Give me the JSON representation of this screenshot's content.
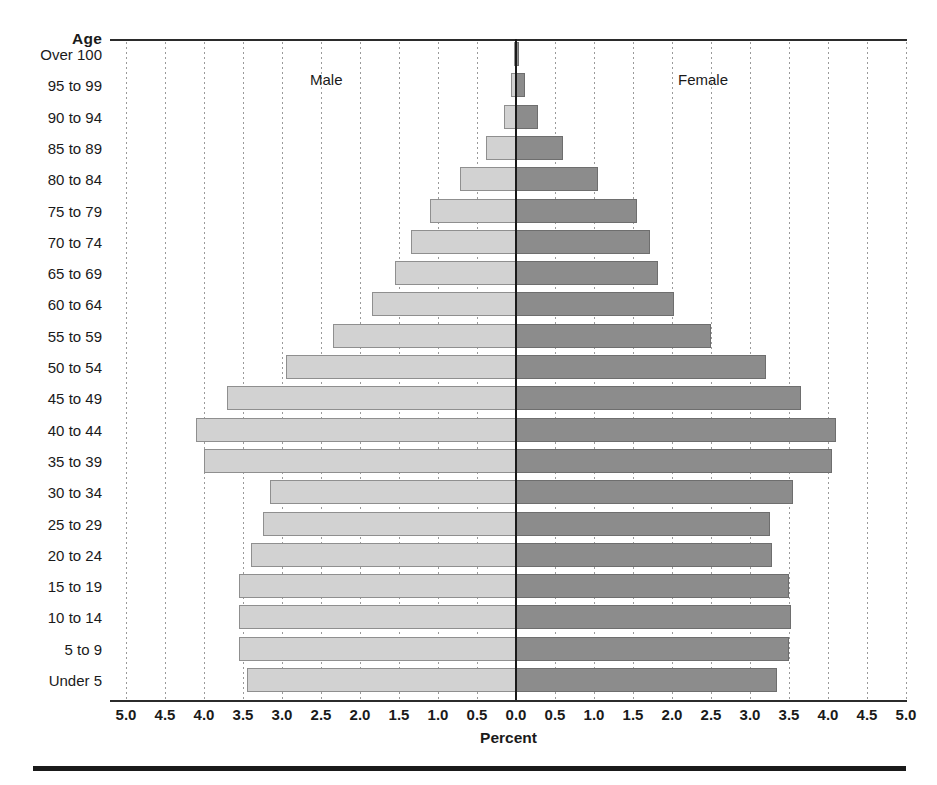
{
  "chart_data": {
    "type": "bar",
    "subtype": "population-pyramid",
    "title": "",
    "xlabel": "Percent",
    "ylabel": "Age",
    "xlim": [
      -5.0,
      5.0
    ],
    "grid": true,
    "legend_position": "in-plot",
    "x_tick_labels": [
      "5.0",
      "4.5",
      "4.0",
      "3.5",
      "3.0",
      "2.5",
      "2.0",
      "1.5",
      "1.0",
      "0.5",
      "0.0",
      "0.5",
      "1.0",
      "1.5",
      "2.0",
      "2.5",
      "3.0",
      "3.5",
      "4.0",
      "4.5",
      "5.0"
    ],
    "x_tick_values": [
      -5.0,
      -4.5,
      -4.0,
      -3.5,
      -3.0,
      -2.5,
      -2.0,
      -1.5,
      -1.0,
      -0.5,
      0.0,
      0.5,
      1.0,
      1.5,
      2.0,
      2.5,
      3.0,
      3.5,
      4.0,
      4.5,
      5.0
    ],
    "categories": [
      "Over 100",
      "95 to 99",
      "90 to 94",
      "85 to 89",
      "80 to 84",
      "75 to 79",
      "70 to 74",
      "65 to 69",
      "60 to 64",
      "55 to 59",
      "50 to 54",
      "45 to 49",
      "40 to 44",
      "35 to 39",
      "30 to 34",
      "25 to 29",
      "20 to 24",
      "15 to 19",
      "10 to 14",
      "5 to 9",
      "Under 5"
    ],
    "series": [
      {
        "name": "Male",
        "side": "left",
        "color": "#d2d2d2",
        "border_color": "#8f8f8f",
        "values": [
          0.01,
          0.06,
          0.16,
          0.38,
          0.72,
          1.1,
          1.35,
          1.55,
          1.85,
          2.35,
          2.95,
          3.7,
          4.1,
          4.0,
          3.15,
          3.25,
          3.4,
          3.55,
          3.55,
          3.55,
          3.45
        ]
      },
      {
        "name": "Female",
        "side": "right",
        "color": "#8c8c8c",
        "border_color": "#6e6e6e",
        "values": [
          0.02,
          0.11,
          0.28,
          0.6,
          1.05,
          1.55,
          1.72,
          1.82,
          2.02,
          2.5,
          3.2,
          3.65,
          4.1,
          4.05,
          3.55,
          3.25,
          3.28,
          3.5,
          3.52,
          3.5,
          3.35
        ]
      }
    ]
  },
  "axes": {
    "age_title": "Age",
    "percent_title": "Percent"
  },
  "series_labels": {
    "male": "Male",
    "female": "Female"
  },
  "colors": {
    "male_fill": "#d2d2d2",
    "female_fill": "#8c8c8c",
    "axis": "#1a1a1a",
    "grid": "#9a9a9a"
  }
}
